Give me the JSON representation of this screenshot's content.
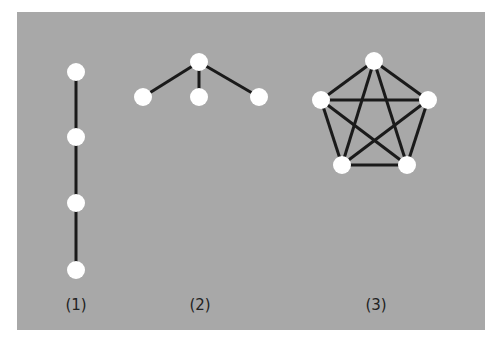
{
  "figure": {
    "background_color": "#a8a8a8",
    "edge_color": "#1a1a1a",
    "node_color": "#ffffff",
    "graphs": [
      {
        "label": "(1)",
        "label_x": 76,
        "nodes": [
          [
            76,
            72
          ],
          [
            76,
            137
          ],
          [
            76,
            203
          ],
          [
            76,
            270
          ]
        ],
        "edges": [
          [
            0,
            1
          ],
          [
            1,
            2
          ],
          [
            2,
            3
          ]
        ]
      },
      {
        "label": "(2)",
        "label_x": 200,
        "nodes": [
          [
            199,
            62
          ],
          [
            143,
            97
          ],
          [
            199,
            97
          ],
          [
            259,
            97
          ]
        ],
        "edges": [
          [
            0,
            1
          ],
          [
            0,
            2
          ],
          [
            0,
            3
          ]
        ]
      },
      {
        "label": "(3)",
        "label_x": 376,
        "nodes": [
          [
            374,
            61
          ],
          [
            321,
            100
          ],
          [
            428,
            100
          ],
          [
            342,
            165
          ],
          [
            407,
            165
          ]
        ],
        "edges": [
          [
            0,
            1
          ],
          [
            0,
            2
          ],
          [
            0,
            3
          ],
          [
            0,
            4
          ],
          [
            1,
            2
          ],
          [
            1,
            3
          ],
          [
            1,
            4
          ],
          [
            2,
            3
          ],
          [
            2,
            4
          ],
          [
            3,
            4
          ]
        ]
      }
    ]
  }
}
